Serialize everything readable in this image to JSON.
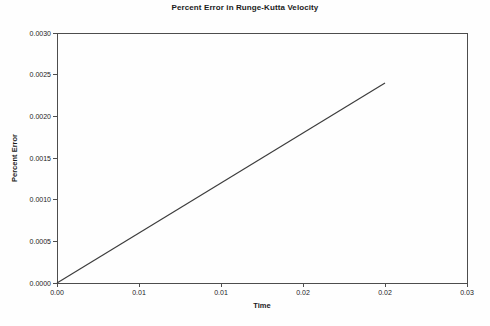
{
  "figure": {
    "background": "#fefefe"
  },
  "chart_data": {
    "type": "line",
    "title": "Percent Error in Runge-Kutta Velocity",
    "xlabel": "Time",
    "ylabel": "Percent Error",
    "xlim": [
      0,
      0.03
    ],
    "ylim": [
      0,
      0.003
    ],
    "x_ticks": [
      {
        "value": 0,
        "label": "0.00"
      },
      {
        "value": 0.006,
        "label": "0.01"
      },
      {
        "value": 0.012,
        "label": "0.01"
      },
      {
        "value": 0.018,
        "label": "0.02"
      },
      {
        "value": 0.024,
        "label": "0.02"
      },
      {
        "value": 0.03,
        "label": "0.03"
      }
    ],
    "y_ticks": [
      {
        "value": 0.0,
        "label": "0.0000"
      },
      {
        "value": 0.0005,
        "label": "0.0005"
      },
      {
        "value": 0.001,
        "label": "0.0010"
      },
      {
        "value": 0.0015,
        "label": "0.0015"
      },
      {
        "value": 0.002,
        "label": "0.0020"
      },
      {
        "value": 0.0025,
        "label": "0.0025"
      },
      {
        "value": 0.003,
        "label": "0.0030"
      }
    ],
    "grid": false,
    "legend": "none",
    "axis_color": "#4d4d4d",
    "text_color": "#1b1b1b",
    "series": [
      {
        "color": "#3d3d3d",
        "points": [
          [
            0,
            0
          ],
          [
            0.024,
            0.0024
          ]
        ]
      }
    ]
  }
}
